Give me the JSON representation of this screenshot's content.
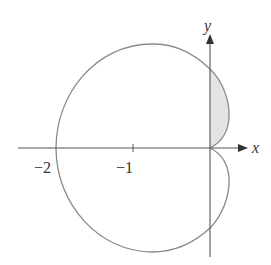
{
  "figure": {
    "type": "polar-curve-diagram",
    "axes": {
      "x_label": "x",
      "y_label": "y",
      "tick_labels": [
        "−2",
        "−1"
      ]
    },
    "curve": {
      "description": "closed polar curve with large outer loop reaching x = −2 and two small lobes right of the y-axis meeting at the origin",
      "leftmost_x": -2,
      "y_axis_crossings": [
        1,
        -1
      ],
      "shaded_region": "upper small lobe between curve and positive y-axis"
    },
    "colors": {
      "curve": "#8a8a8a",
      "axis": "#555555",
      "shade": "#e4e4e4"
    }
  }
}
